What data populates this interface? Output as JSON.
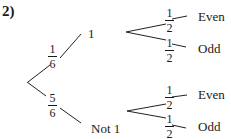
{
  "question_number": "2)",
  "tree": {
    "first_stage": [
      {
        "outcome": "1",
        "prob_num": "1",
        "prob_den": "6"
      },
      {
        "outcome": "Not 1",
        "prob_num": "5",
        "prob_den": "6"
      }
    ],
    "second_stage": {
      "after_1": [
        {
          "outcome": "Even",
          "prob_num": "1",
          "prob_den": "2"
        },
        {
          "outcome": "Odd",
          "prob_num": "1",
          "prob_den": "2"
        }
      ],
      "after_not_1": [
        {
          "outcome": "Even",
          "prob_num": "1",
          "prob_den": "2"
        },
        {
          "outcome": "Odd",
          "prob_num": "1",
          "prob_den": "2"
        }
      ]
    }
  }
}
